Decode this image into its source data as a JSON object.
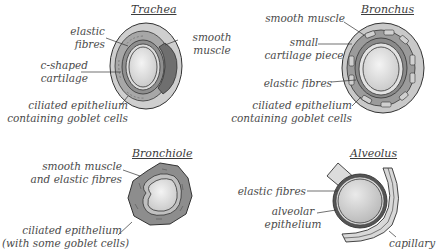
{
  "diagrams": {
    "trachea": {
      "title": "Trachea",
      "labels": {
        "elastic_1": "elastic",
        "elastic_2": "fibres",
        "smooth_1": "smooth",
        "smooth_2": "muscle",
        "cart_1": "c-shaped",
        "cart_2": "cartilage",
        "cil_1": "ciliated epithelium",
        "cil_2": "containing goblet cells"
      }
    },
    "bronchus": {
      "title": "Bronchus",
      "labels": {
        "smooth": "smooth muscle",
        "small_1": "small",
        "small_2": "cartilage piece",
        "elastic": "elastic fibres",
        "cil_1": "ciliated epithelium",
        "cil_2": "containing goblet cells"
      }
    },
    "bronchiole": {
      "title": "Bronchiole",
      "labels": {
        "sm_1": "smooth muscle",
        "sm_2": "and elastic fibres",
        "cil_1": "ciliated epithelium",
        "cil_2": "(with some goblet cells)"
      }
    },
    "alveolus": {
      "title": "Alveolus",
      "labels": {
        "elastic": "elastic fibres",
        "alv_1": "alveolar",
        "alv_2": "epithelium",
        "capillary": "capillary"
      }
    }
  },
  "colors": {
    "outer": "#c9c9c9",
    "mid": "#9a9a9a",
    "dark": "#6e6e6e",
    "lumen": "#e4e4e4",
    "stroke": "#333333",
    "text": "#4a4a4a"
  }
}
